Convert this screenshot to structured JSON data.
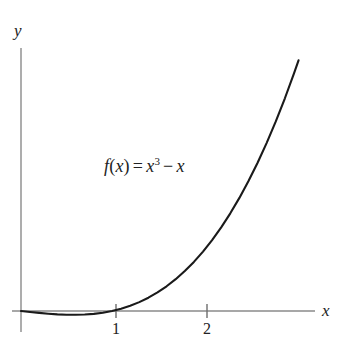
{
  "figure": {
    "background_color": "#ffffff",
    "curve_color": "#1a1a1a",
    "axis_color": "#808080",
    "text_color": "#222222"
  },
  "axes": {
    "x_label": "x",
    "y_label": "y",
    "x_ticks": [
      {
        "value": 1,
        "label": "1"
      },
      {
        "value": 2,
        "label": "2"
      }
    ],
    "y_ticks": []
  },
  "annotation": {
    "function_text": "f(x) = x³ − x",
    "f_var": "f",
    "open_paren": "(",
    "arg_var": "x",
    "close_paren": ")",
    "equals": "=",
    "base_var": "x",
    "exponent": "3",
    "minus": "−",
    "last_var": "x"
  },
  "chart_data": {
    "type": "line",
    "title": "",
    "xlabel": "x",
    "ylabel": "y",
    "legend": [],
    "grid": false,
    "xlim": [
      -0.07,
      3.63
    ],
    "ylim": [
      -3.0,
      25.5
    ],
    "expression": "f(x) = x^3 - x",
    "annotations": [
      {
        "text": "f(x) = x³ − x",
        "x": 0.95,
        "y": 10.5
      }
    ],
    "series": [
      {
        "name": "f(x) = x^3 - x",
        "x": [
          0.0,
          0.1,
          0.2,
          0.3,
          0.4,
          0.5,
          0.577,
          0.6,
          0.7,
          0.8,
          0.9,
          1.0,
          1.1,
          1.2,
          1.3,
          1.4,
          1.5,
          1.6,
          1.7,
          1.8,
          1.9,
          2.0,
          2.1,
          2.2,
          2.3,
          2.4,
          2.5,
          2.6,
          2.7,
          2.8,
          2.9,
          3.0,
          3.05
        ],
        "y": [
          0.0,
          -0.099,
          -0.192,
          -0.273,
          -0.336,
          -0.375,
          -0.385,
          -0.384,
          -0.357,
          -0.288,
          -0.171,
          0.0,
          0.231,
          0.528,
          0.897,
          1.344,
          1.875,
          2.496,
          3.213,
          4.032,
          4.959,
          6.0,
          7.161,
          8.448,
          9.867,
          11.424,
          13.125,
          14.976,
          16.983,
          19.152,
          21.489,
          24.0,
          25.32
        ]
      }
    ]
  },
  "geometry": {
    "origin_x_px": 21,
    "origin_y_px": 311,
    "x_unit_px": 91,
    "y_unit_px": 9.9,
    "y_axis_top_px": 48,
    "y_axis_bottom_px": 332,
    "x_axis_right_px": 315,
    "tick_half_height_px": 6
  }
}
